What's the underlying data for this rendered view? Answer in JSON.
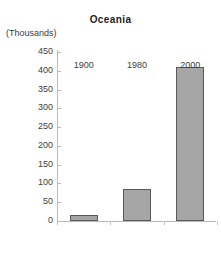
{
  "chart_data": {
    "type": "bar",
    "title": "Oceania",
    "subtitle": "",
    "xlabel": "",
    "ylabel": "(Thousands)",
    "categories": [
      "1900",
      "1980",
      "2000"
    ],
    "values": [
      15,
      85,
      410
    ],
    "series": [
      {
        "name": "Oceania",
        "values": [
          15,
          85,
          410
        ]
      }
    ],
    "ylim": [
      0,
      450
    ],
    "ytick_step": 50,
    "yticks": [
      0,
      50,
      100,
      150,
      200,
      250,
      300,
      350,
      400,
      450
    ],
    "ytick_labels": [
      "0",
      "50",
      "100",
      "150",
      "200",
      "250",
      "300",
      "350",
      "400",
      "450"
    ],
    "grid": false,
    "legend": false,
    "legend_position": "none",
    "units": "Thousands",
    "colors": {
      "bar_fill": "#a6a6a6",
      "bar_border": "#595959",
      "axis": "#b9b9b9",
      "text": "#3d3d3d",
      "title": "#222222",
      "background": "#ffffff"
    }
  }
}
